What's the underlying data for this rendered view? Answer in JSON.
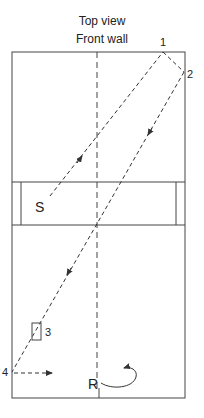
{
  "header": {
    "title": "Top view",
    "subtitle": "Front wall"
  },
  "labels": {
    "point1": "1",
    "point2": "2",
    "point3": "3",
    "point4": "4",
    "server": "S",
    "receiver": "R"
  },
  "colors": {
    "line": "#333333",
    "background": "#ffffff"
  }
}
